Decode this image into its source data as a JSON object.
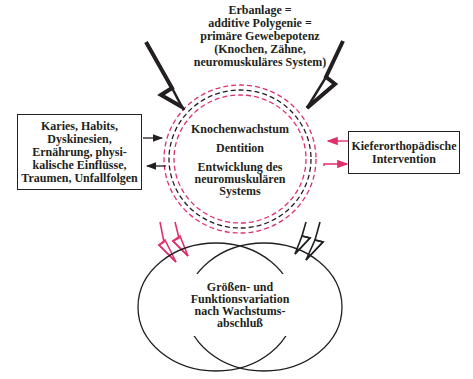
{
  "colors": {
    "ink": "#231f20",
    "accent": "#e0306a"
  },
  "top_label": {
    "lines": [
      "Erbanlage =",
      "additive Polygenie =",
      "primäre Gewebepotenz",
      "(Knochen, Zähne,",
      "neuromuskuläres System)"
    ]
  },
  "left_box": {
    "lines": [
      "Karies, Habits,",
      "Dyskinesien,",
      "Ernährung, physi-",
      "kalische Einflüsse,",
      "Traumen, Unfallfolgen"
    ]
  },
  "right_box": {
    "lines": [
      "Kieferorthopädische",
      "Intervention"
    ]
  },
  "center_circle": {
    "items": [
      "Knochenwachstum",
      "Dentition",
      "Entwicklung des",
      "neuromuskulären",
      "Systems"
    ]
  },
  "bottom_circle": {
    "lines": [
      "Größen- und",
      "Funktionsvariation",
      "nach Wachstums-",
      "abschluß"
    ]
  },
  "icons": {
    "top_left_bolt": "lightning-bolt-arrow",
    "top_right_bolt": "lightning-bolt-arrow",
    "bottom_left_bolts": "double-lightning-bolt-pink",
    "bottom_right_bolts": "double-lightning-bolt-black"
  }
}
